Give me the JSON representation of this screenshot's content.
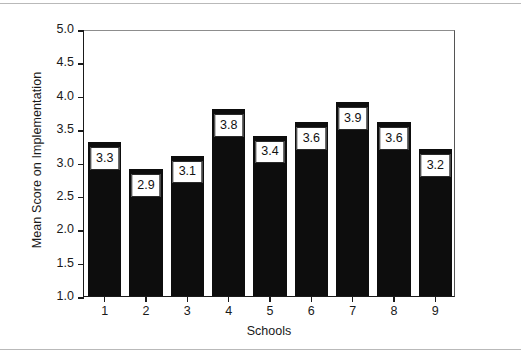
{
  "figure": {
    "background_color": "#ffffff",
    "frame_color": "#b9b9b9"
  },
  "chart_data": {
    "type": "bar",
    "title": "",
    "xlabel": "Schools",
    "ylabel": "Mean Score on Implementation",
    "categories": [
      "1",
      "2",
      "3",
      "4",
      "5",
      "6",
      "7",
      "8",
      "9"
    ],
    "values": [
      3.3,
      2.9,
      3.1,
      3.8,
      3.4,
      3.6,
      3.9,
      3.6,
      3.2
    ],
    "value_labels": [
      "3.3",
      "2.9",
      "3.1",
      "3.8",
      "3.4",
      "3.6",
      "3.9",
      "3.6",
      "3.2"
    ],
    "ylim": [
      1.0,
      5.0
    ],
    "ytick_labels": [
      "5.0",
      "4.5",
      "4.0",
      "3.5",
      "3.0",
      "2.5",
      "2.0",
      "1.5",
      "1.0"
    ],
    "ytick_values": [
      5.0,
      4.5,
      4.0,
      3.5,
      3.0,
      2.5,
      2.0,
      1.5,
      1.0
    ],
    "grid": false,
    "legend": null,
    "bar_color": "#0d0d0d",
    "label_box_background": "#ffffff",
    "label_box_border": "#2a2a2a"
  }
}
